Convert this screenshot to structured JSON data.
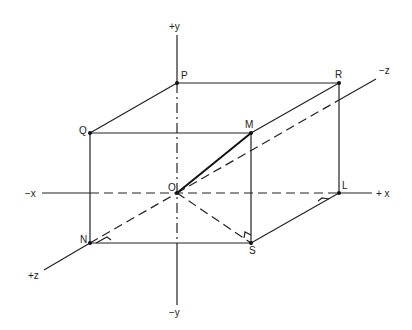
{
  "diagram": {
    "type": "3d-coordinate-box",
    "axes": {
      "pos_y": "+y",
      "neg_y": "−y",
      "pos_x": "+ x",
      "neg_x": "−x",
      "pos_z": "+z",
      "neg_z": "−z"
    },
    "points": {
      "O": "O",
      "P": "P",
      "R": "R",
      "Q": "Q",
      "M": "M",
      "N": "N",
      "S": "S",
      "L": "L"
    },
    "highlighted_segment": "OM",
    "right_angle_markers": [
      "N",
      "L",
      "S"
    ]
  }
}
